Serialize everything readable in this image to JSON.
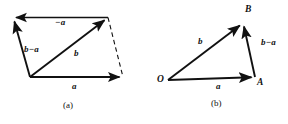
{
  "figure": {
    "background_color": "#ffffff",
    "stroke_color": "#111111",
    "panels": [
      {
        "id": "panel-a",
        "caption": "(a)",
        "type": "parallelogram-vector-diagram",
        "vertices": {
          "top_left": [
            13,
            17
          ],
          "top_right": [
            108,
            17
          ],
          "bottom_left": [
            30,
            77
          ],
          "bottom_right": [
            123,
            77
          ]
        },
        "arrows": [
          {
            "name": "minus-a",
            "label": "−a",
            "from": [
              108,
              17
            ],
            "to": [
              13,
              17
            ],
            "style": "solid"
          },
          {
            "name": "b-minus-a",
            "label": "b−a",
            "from": [
              30,
              77
            ],
            "to": [
              13,
              17
            ],
            "style": "solid"
          },
          {
            "name": "b",
            "label": "b",
            "from": [
              30,
              77
            ],
            "to": [
              108,
              17
            ],
            "style": "solid"
          },
          {
            "name": "a",
            "label": "a",
            "from": [
              30,
              77
            ],
            "to": [
              123,
              77
            ],
            "style": "solid"
          },
          {
            "name": "closing-edge",
            "label": "",
            "from": [
              108,
              17
            ],
            "to": [
              123,
              77
            ],
            "style": "dashed"
          }
        ],
        "labels": [
          {
            "name": "label-minus-a",
            "text": "−a",
            "x": 55,
            "y": 18
          },
          {
            "name": "label-b-minus-a",
            "text": "b−a",
            "x": 24,
            "y": 45
          },
          {
            "name": "label-b",
            "text": "b",
            "x": 74,
            "y": 49
          },
          {
            "name": "label-a",
            "text": "a",
            "x": 72,
            "y": 82
          }
        ]
      },
      {
        "id": "panel-b",
        "caption": "(b)",
        "type": "triangle-vector-diagram",
        "vertices": {
          "O": [
            168,
            80
          ],
          "A": [
            255,
            77
          ],
          "B": [
            243,
            22
          ]
        },
        "point_labels": [
          {
            "name": "point-label-O",
            "text": "O",
            "x": 157,
            "y": 75
          },
          {
            "name": "point-label-A",
            "text": "A",
            "x": 257,
            "y": 78
          },
          {
            "name": "point-label-B",
            "text": "B",
            "x": 245,
            "y": 5
          }
        ],
        "arrows": [
          {
            "name": "b",
            "label": "b",
            "from": [
              168,
              80
            ],
            "to": [
              243,
              22
            ],
            "style": "solid"
          },
          {
            "name": "a",
            "label": "a",
            "from": [
              168,
              80
            ],
            "to": [
              255,
              77
            ],
            "style": "solid"
          },
          {
            "name": "b-minus-a",
            "label": "b−a",
            "from": [
              255,
              77
            ],
            "to": [
              243,
              22
            ],
            "style": "solid"
          }
        ],
        "labels": [
          {
            "name": "label-b",
            "text": "b",
            "x": 198,
            "y": 37
          },
          {
            "name": "label-a",
            "text": "a",
            "x": 216,
            "y": 82
          },
          {
            "name": "label-b-minus-a",
            "text": "b−a",
            "x": 261,
            "y": 38
          }
        ]
      }
    ],
    "captions": [
      {
        "name": "caption-a",
        "text": "(a)",
        "x": 63,
        "y": 101
      },
      {
        "name": "caption-b",
        "text": "(b)",
        "x": 211,
        "y": 99
      }
    ]
  }
}
